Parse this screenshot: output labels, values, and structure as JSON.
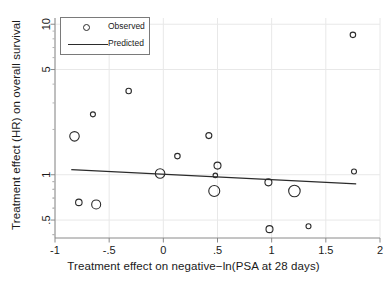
{
  "chart_data": {
    "type": "scatter",
    "title": "",
    "xlabel": "Treatment effect on negative−ln(PSA at 28 days)",
    "ylabel": "Treatment effect (HR) on overall survival",
    "xlim": [
      -1,
      2
    ],
    "ylim": [
      0.38,
      11
    ],
    "yscale": "log",
    "xscale": "linear",
    "xticks": [
      -1,
      -0.5,
      0,
      0.5,
      1,
      1.5,
      2
    ],
    "xticklabels": [
      "-1",
      "-.5",
      "0",
      ".5",
      "1",
      "1.5",
      "2"
    ],
    "yticks": [
      0.5,
      1,
      5,
      10
    ],
    "yticklabels": [
      ".5",
      "1",
      "5",
      "10"
    ],
    "grid": true,
    "legend_position": "upper left",
    "legend": [
      {
        "label": "Observed",
        "marker": "open-circle"
      },
      {
        "label": "Predicted",
        "marker": "line"
      }
    ],
    "series": [
      {
        "name": "Observed",
        "marker": "open-circle",
        "note": "bubble radius proportional to study weight",
        "points": [
          {
            "x": -0.82,
            "y": 1.8,
            "size": 9.5
          },
          {
            "x": -0.65,
            "y": 2.52,
            "size": 5.0
          },
          {
            "x": -0.78,
            "y": 0.655,
            "size": 6.5
          },
          {
            "x": -0.62,
            "y": 0.635,
            "size": 9.0
          },
          {
            "x": -0.32,
            "y": 3.6,
            "size": 5.5
          },
          {
            "x": -0.03,
            "y": 1.02,
            "size": 9.5
          },
          {
            "x": 0.13,
            "y": 1.33,
            "size": 5.5
          },
          {
            "x": 0.42,
            "y": 1.82,
            "size": 6.0
          },
          {
            "x": 0.5,
            "y": 1.15,
            "size": 7.0
          },
          {
            "x": 0.48,
            "y": 0.99,
            "size": 4.5
          },
          {
            "x": 0.47,
            "y": 0.78,
            "size": 11.0
          },
          {
            "x": 0.97,
            "y": 0.89,
            "size": 7.0
          },
          {
            "x": 0.98,
            "y": 0.435,
            "size": 7.0
          },
          {
            "x": 1.21,
            "y": 0.78,
            "size": 11.5
          },
          {
            "x": 1.34,
            "y": 0.455,
            "size": 5.0
          },
          {
            "x": 1.76,
            "y": 1.05,
            "size": 5.0
          },
          {
            "x": 1.75,
            "y": 8.5,
            "size": 5.5
          }
        ]
      },
      {
        "name": "Predicted",
        "type": "line",
        "x": [
          -0.85,
          1.78
        ],
        "y": [
          1.08,
          0.87
        ]
      }
    ]
  }
}
